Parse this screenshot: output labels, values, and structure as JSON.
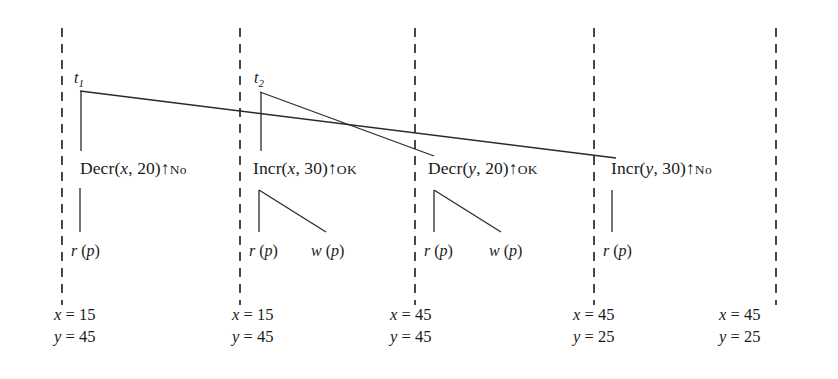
{
  "figure": {
    "type": "timeline-diagram",
    "background_color": "#ffffff",
    "line_color": "#2a2a2a"
  },
  "time_boundaries": [
    {
      "id": "b1",
      "x": 62
    },
    {
      "id": "b2",
      "x": 240
    },
    {
      "id": "b3",
      "x": 415
    },
    {
      "id": "b4",
      "x": 594
    },
    {
      "id": "b5",
      "x": 776
    }
  ],
  "transactions": [
    {
      "id": "t1",
      "name": "t",
      "index": "1",
      "label_x": 74,
      "label_y": 70
    },
    {
      "id": "t2",
      "name": "t",
      "index": "2",
      "label_x": 254,
      "label_y": 70
    }
  ],
  "operations": [
    {
      "id": "op1",
      "name": "Decr",
      "args": "(x, 20)",
      "var": "x",
      "value": "20",
      "arrow": "↑",
      "return": "No",
      "text": "Decr(x, 20)↑No",
      "x": 80,
      "y": 160
    },
    {
      "id": "op2",
      "name": "Incr",
      "args": "(x, 30)",
      "var": "x",
      "value": "30",
      "arrow": "↑",
      "return": "OK",
      "text": "Incr(x, 30)↑OK",
      "x": 253,
      "y": 160
    },
    {
      "id": "op3",
      "name": "Decr",
      "args": "(y, 20)",
      "var": "y",
      "value": "20",
      "arrow": "↑",
      "return": "OK",
      "text": "Decr(y, 20)↑OK",
      "x": 428,
      "y": 160
    },
    {
      "id": "op4",
      "name": "Incr",
      "args": "(y, 30)",
      "var": "y",
      "value": "30",
      "arrow": "↑",
      "return": "No",
      "text": "Incr(y, 30)↑No",
      "x": 611,
      "y": 160
    }
  ],
  "sub_operations": [
    {
      "id": "sub1",
      "text": "r (p)",
      "kind": "read",
      "x": 71,
      "y": 243
    },
    {
      "id": "sub2",
      "text": "r (p)",
      "kind": "read",
      "x": 249,
      "y": 243
    },
    {
      "id": "sub3",
      "text": "w (p)",
      "kind": "write",
      "x": 311,
      "y": 243
    },
    {
      "id": "sub4",
      "text": "r (p)",
      "kind": "read",
      "x": 424,
      "y": 243
    },
    {
      "id": "sub5",
      "text": "w (p)",
      "kind": "write",
      "x": 489,
      "y": 243
    },
    {
      "id": "sub6",
      "text": "r (p)",
      "kind": "read",
      "x": 603,
      "y": 243
    }
  ],
  "states": [
    {
      "id": "s1",
      "x_line": "x = 15",
      "y_line": "y = 45",
      "x": 54,
      "y": 310
    },
    {
      "id": "s2",
      "x_line": "x = 15",
      "y_line": "y = 45",
      "x": 232,
      "y": 310
    },
    {
      "id": "s3",
      "x_line": "x = 45",
      "y_line": "y = 45",
      "x": 390,
      "y": 310
    },
    {
      "id": "s4",
      "x_line": "x = 45",
      "y_line": "y = 25",
      "x": 573,
      "y": 310
    },
    {
      "id": "s5",
      "x_line": "x = 45",
      "y_line": "y = 25",
      "x": 719,
      "y": 310
    }
  ]
}
